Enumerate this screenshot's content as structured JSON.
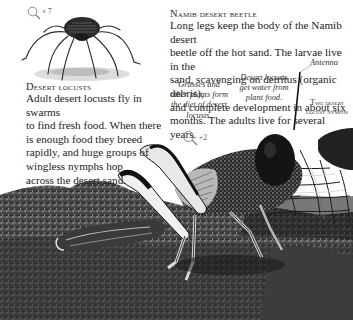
{
  "beetle": {
    "heading": "Namib desert beetle",
    "body_lines": [
      "Long legs keep the body of the Namib desert",
      "beetle off the hot sand. The larvae live in the",
      "sand, scavenging on detritus (organic debris),",
      "and complete development in about six",
      "months. The adults live for several years."
    ],
    "scale": {
      "icon": "magnifier-icon",
      "label": "× 7"
    },
    "image": "namib-desert-beetle-illustration"
  },
  "locusts": {
    "heading": "Desert locusts",
    "body_lines": [
      "Adult desert locusts fly in swarms",
      "to find fresh food. When there",
      "is enough food they breed",
      "rapidly, and huge groups of",
      "wingless nymphs hop",
      "across the desert sand."
    ],
    "scale": {
      "icon": "magnifier-icon",
      "label": "+2"
    },
    "image": "desert-locust-photo"
  },
  "captions": {
    "grasses": [
      "Grasses and",
      "other plants form",
      "the diet of desert",
      "locusts."
    ],
    "water": [
      "Desert locusts",
      "get water from",
      "plant food."
    ],
    "antenna": "Antenna",
    "nymphs": [
      "Two desert",
      "locust nymphs"
    ]
  },
  "colors": {
    "background": "#ffffff",
    "text": "#222222",
    "sand_dark": "#3a3a3a",
    "sand_light": "#8a8a8a"
  }
}
